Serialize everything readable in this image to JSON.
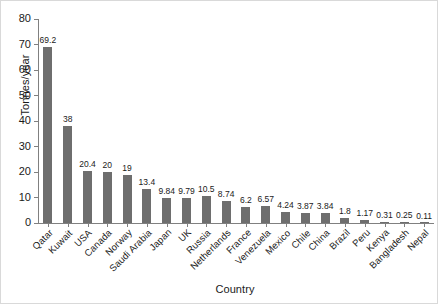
{
  "chart_data": {
    "type": "bar",
    "title": "",
    "xlabel": "Country",
    "ylabel": "Tonnes/year",
    "ylim": [
      0,
      80
    ],
    "yticks": [
      0,
      10,
      20,
      30,
      40,
      50,
      60,
      70,
      80
    ],
    "grid": false,
    "legend": null,
    "bar_color": "#6e6e6e",
    "categories": [
      "Qatar",
      "Kuwait",
      "USA",
      "Canada",
      "Norway",
      "Saudi Arabia",
      "Japan",
      "UK",
      "Russia",
      "Netherlands",
      "France",
      "Venezuela",
      "Mexico",
      "Chile",
      "China",
      "Brazil",
      "Peru",
      "Kenya",
      "Bangladesh",
      "Nepal"
    ],
    "values": [
      69.2,
      38,
      20.4,
      20,
      19,
      13.4,
      9.84,
      9.79,
      10.5,
      8.74,
      6.2,
      6.57,
      4.24,
      3.87,
      3.84,
      1.8,
      1.17,
      0.31,
      0.25,
      0.11
    ],
    "value_labels": [
      "69.2",
      "38",
      "20.4",
      "20",
      "19",
      "13.4",
      "9.84",
      "9.79",
      "10.5",
      "8.74",
      "6.2",
      "6.57",
      "4.24",
      "3.87",
      "3.84",
      "1.8",
      "1.17",
      "0.31",
      "0.25",
      "0.11"
    ]
  }
}
